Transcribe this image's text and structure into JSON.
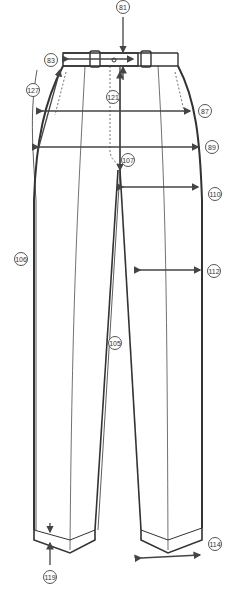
{
  "diagram": {
    "line_color": "#333333",
    "arrow_color": "#444444",
    "labels": [
      {
        "id": "81",
        "point": "waistband-height",
        "x": 123,
        "y": 3
      },
      {
        "id": "83",
        "point": "waist-width",
        "x": 45,
        "y": 55
      },
      {
        "id": "127",
        "point": "side-seam-waist-to-hip",
        "x": 26,
        "y": 82
      },
      {
        "id": "121",
        "point": "front-rise",
        "x": 114,
        "y": 92
      },
      {
        "id": "87",
        "point": "hip-width",
        "x": 198,
        "y": 103
      },
      {
        "id": "89",
        "point": "seat-width",
        "x": 205,
        "y": 138
      },
      {
        "id": "107",
        "point": "crotch-point",
        "x": 122,
        "y": 152
      },
      {
        "id": "110",
        "point": "thigh-width",
        "x": 207,
        "y": 187
      },
      {
        "id": "106",
        "point": "outseam",
        "x": 14,
        "y": 254
      },
      {
        "id": "112",
        "point": "knee-width",
        "x": 207,
        "y": 265
      },
      {
        "id": "105",
        "point": "inseam",
        "x": 108,
        "y": 335
      },
      {
        "id": "114",
        "point": "leg-opening",
        "x": 208,
        "y": 537
      },
      {
        "id": "119",
        "point": "cuff-height",
        "x": 43,
        "y": 572
      }
    ]
  }
}
